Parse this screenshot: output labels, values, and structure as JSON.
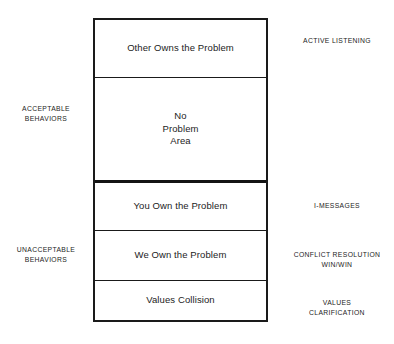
{
  "diagram": {
    "background_color": "#ffffff",
    "line_color": "#1a1a1a",
    "zones": [
      {
        "id": "other-owns-the-problem",
        "label": "Other Owns the Problem"
      },
      {
        "id": "no-problem-area",
        "label": "No\nProblem\nArea"
      },
      {
        "id": "you-own-the-problem",
        "label": "You Own the Problem"
      },
      {
        "id": "we-own-the-problem",
        "label": "We Own the Problem"
      },
      {
        "id": "values-collision",
        "label": "Values Collision"
      }
    ],
    "left_notes": [
      {
        "id": "acceptable-behaviors",
        "label": "ACCEPTABLE\nBEHAVIORS"
      },
      {
        "id": "unacceptable-behaviors",
        "label": "UNACCEPTABLE\nBEHAVIORS"
      }
    ],
    "right_notes": [
      {
        "id": "active-listening",
        "label": "ACTIVE LISTENING"
      },
      {
        "id": "i-messages",
        "label": "I-MESSAGES"
      },
      {
        "id": "conflict-resolution",
        "label": "CONFLICT RESOLUTION\nWIN/WIN"
      },
      {
        "id": "values-clarification",
        "label": "VALUES\nCLARIFICATION"
      }
    ]
  }
}
